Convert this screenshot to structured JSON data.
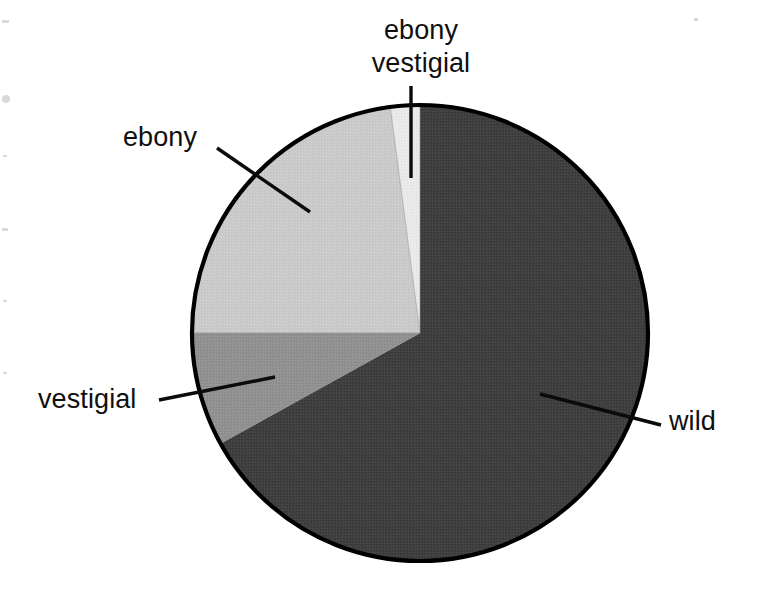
{
  "figure": {
    "background_color": "#ffffff",
    "outline_color": "#000000",
    "label_color": "#100f0f"
  },
  "chart_data": {
    "type": "pie",
    "title": "",
    "subtitle": "",
    "xlabel": "",
    "ylabel": "",
    "grid": false,
    "legend_position": "callout-labels",
    "start_angle_deg": 0,
    "direction": "clockwise",
    "center_px": [
      420,
      333
    ],
    "radius_px": 228,
    "labels": [
      "wild",
      "vestigial",
      "ebony",
      "ebony vestigial"
    ],
    "values": [
      67,
      8,
      23,
      2
    ],
    "percentages": [
      "67%",
      "8%",
      "23%",
      "2%"
    ],
    "slices": [
      {
        "label": "wild",
        "value": 67,
        "percent": "67%",
        "color": "#3f3f3f",
        "start_angle_deg": 0,
        "end_angle_deg": 241
      },
      {
        "label": "vestigial",
        "value": 8,
        "percent": "8%",
        "color": "#919191",
        "start_angle_deg": 241,
        "end_angle_deg": 270
      },
      {
        "label": "ebony",
        "value": 23,
        "percent": "23%",
        "color": "#cacaca",
        "start_angle_deg": 270,
        "end_angle_deg": 352.5
      },
      {
        "label": "ebony vestigial",
        "value": 2,
        "percent": "2%",
        "color": "#e9e9e9",
        "start_angle_deg": 352.5,
        "end_angle_deg": 360
      }
    ]
  },
  "callouts": {
    "ebony_vestigial": {
      "label": "ebony\nvestigial",
      "line1": "ebony",
      "line2": "vestigial"
    },
    "ebony": {
      "label": "ebony"
    },
    "vestigial": {
      "label": "vestigial"
    },
    "wild": {
      "label": "wild"
    }
  }
}
